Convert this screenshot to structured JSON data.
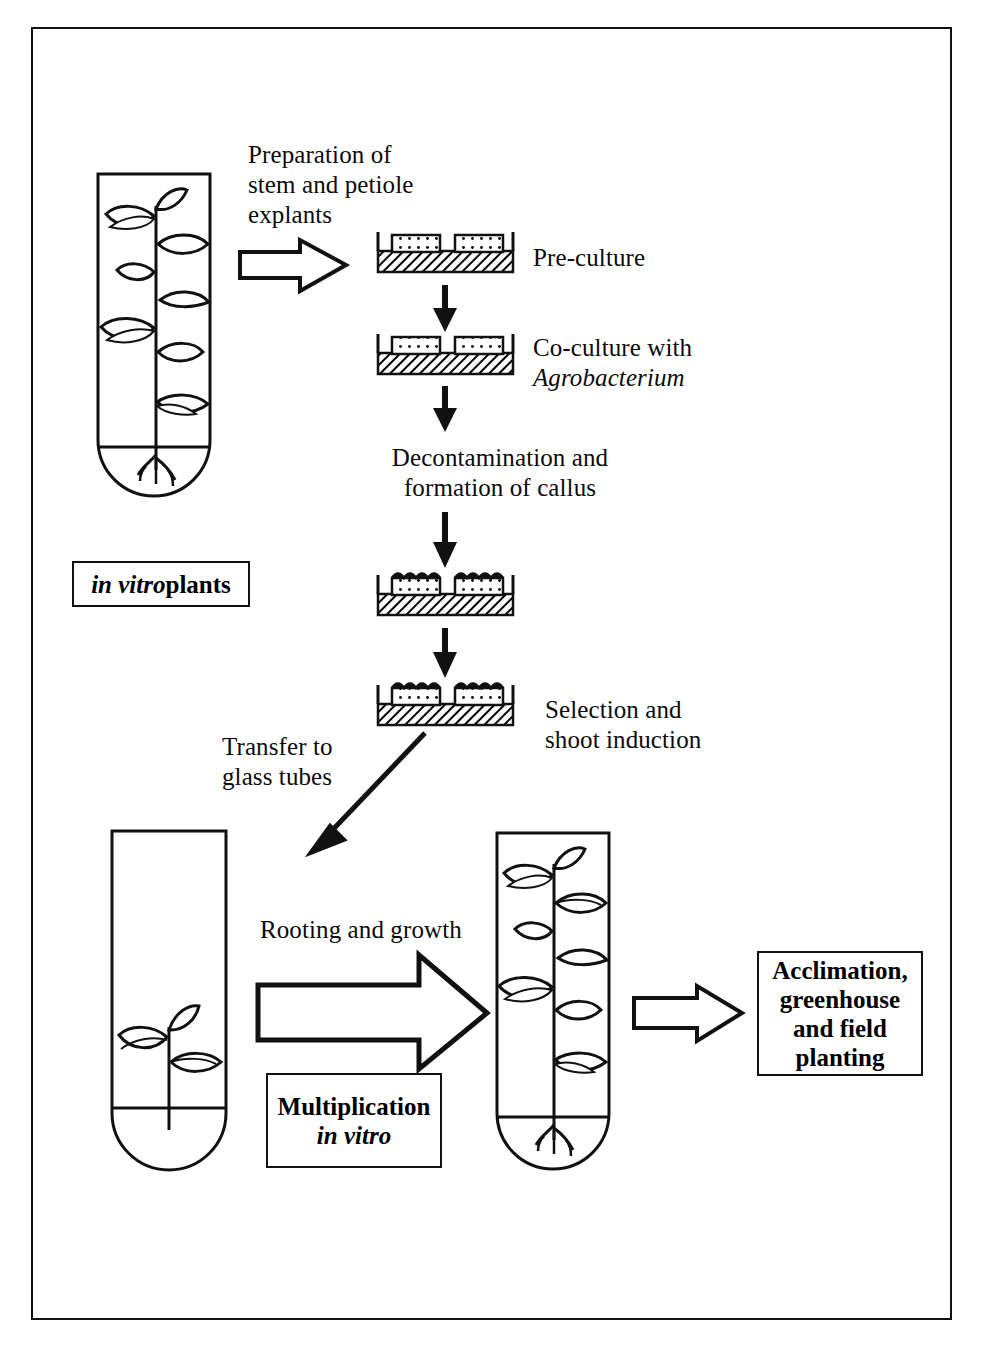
{
  "diagram": {
    "border_color": "#111111",
    "background": "#ffffff"
  },
  "labels": {
    "preparation": "Preparation of\nstem and petiole\nexplants",
    "pre_culture": "Pre-culture",
    "co_culture_line1": "Co-culture with",
    "co_culture_line2": "Agrobacterium",
    "decontamination": "Decontamination and\nformation of callus",
    "selection": "Selection and\nshoot induction",
    "transfer": "Transfer to\nglass tubes",
    "rooting": "Rooting and growth"
  },
  "boxes": {
    "in_vitro_plants": {
      "italic_part": "in vitro",
      "roman_part": " plants"
    },
    "multiplication": {
      "line1": "Multiplication",
      "line2": "in vitro"
    },
    "acclimation": {
      "line1": "Acclimation,",
      "line2": "greenhouse",
      "line3": "and field",
      "line4": "planting"
    }
  },
  "figures": {
    "tube_top_left": "test-tube-with-mature-plant",
    "tube_bottom_left": "test-tube-with-plantlet",
    "tube_bottom_middle": "test-tube-with-mature-plant",
    "petri_pre_culture": "petri-dish-with-explants",
    "petri_co_culture": "petri-dish-with-explants",
    "petri_callus_1": "petri-dish-with-callus",
    "petri_callus_2": "petri-dish-with-callus"
  },
  "arrows": {
    "block_arrow_explants": "right-block-arrow",
    "arrow_pre_to_co": "down-arrow",
    "arrow_co_to_callus": "down-arrow",
    "arrow_callus_to_selection": "down-arrow",
    "arrow_transfer": "diagonal-down-left-arrow",
    "block_arrow_rooting": "right-block-arrow-large",
    "block_arrow_acclimation": "right-block-arrow-small"
  }
}
